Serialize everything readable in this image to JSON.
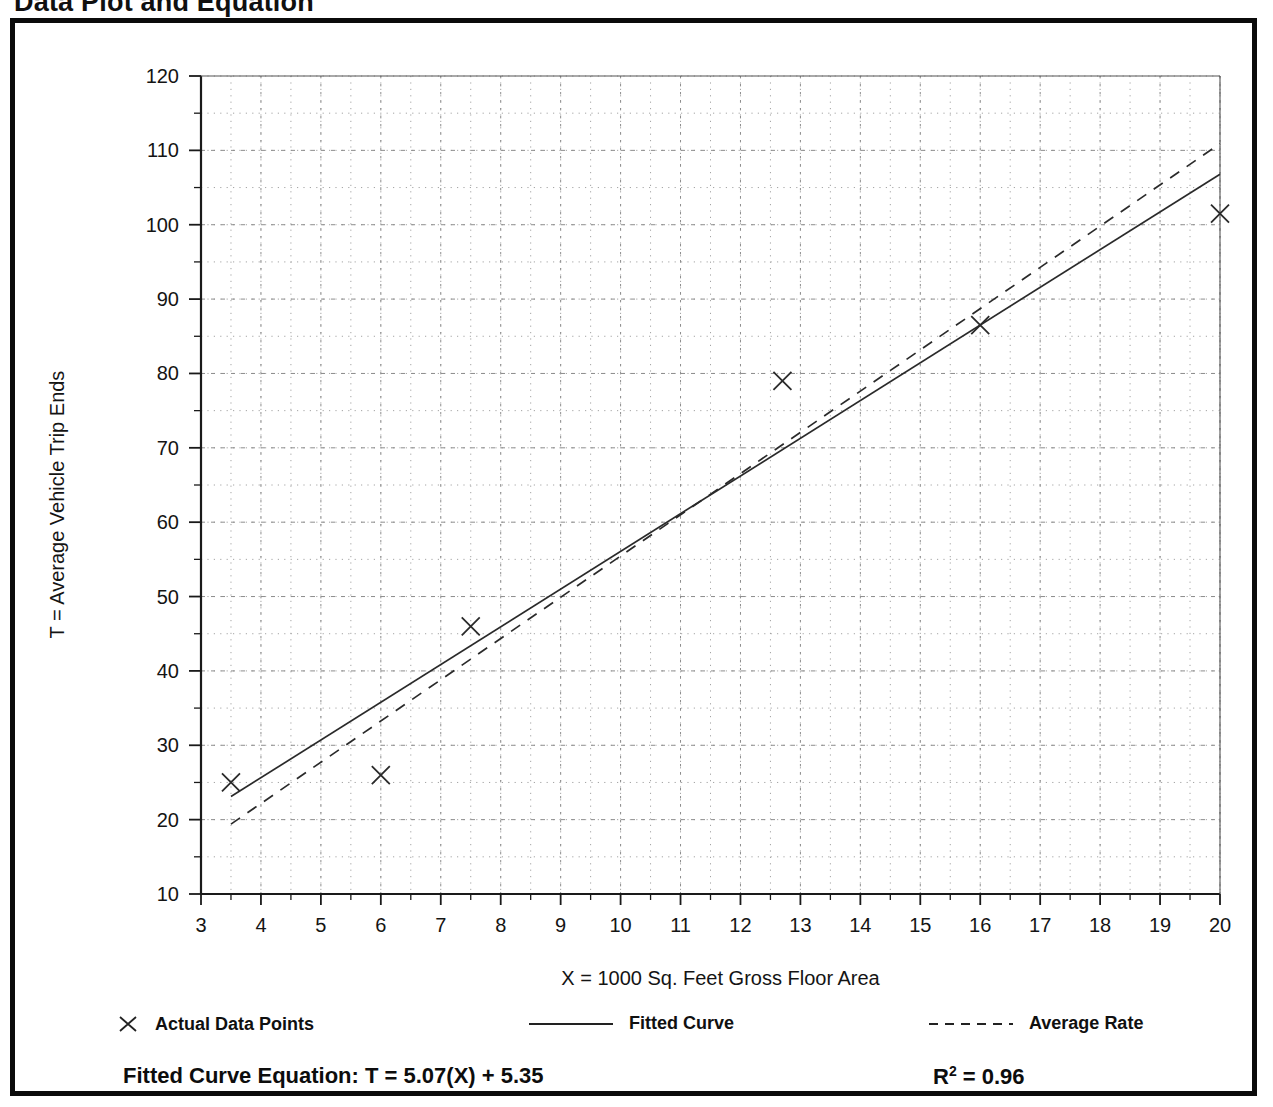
{
  "page_title": "Data Plot and Equation",
  "axes": {
    "x_title": "X = 1000 Sq. Feet Gross Floor Area",
    "y_title": "T = Average Vehicle Trip Ends"
  },
  "legend": {
    "items": [
      {
        "label": "Actual Data Points",
        "marker": "x-cross-marker"
      },
      {
        "label": "Fitted Curve",
        "marker": "solid-line-swatch"
      },
      {
        "label": "Average Rate",
        "marker": "dashed-line-swatch"
      }
    ]
  },
  "equation": {
    "label": "Fitted Curve Equation:",
    "expression": "T = 5.07(X) + 5.35",
    "full": "Fitted Curve Equation:  T = 5.07(X) + 5.35",
    "r_squared_label": "R",
    "r_squared_exponent": "2",
    "r_squared_value": "= 0.96",
    "r_squared_full": "R2 = 0.96"
  },
  "chart_data": {
    "type": "scatter",
    "title": "Data Plot and Equation",
    "xlabel": "X = 1000 Sq. Feet Gross Floor Area",
    "ylabel": "T = Average Vehicle Trip Ends",
    "xlim": [
      3,
      20
    ],
    "ylim": [
      10,
      120
    ],
    "xticks": [
      3,
      4,
      5,
      6,
      7,
      8,
      9,
      10,
      11,
      12,
      13,
      14,
      15,
      16,
      17,
      18,
      19,
      20
    ],
    "yticks": [
      10,
      20,
      30,
      40,
      50,
      60,
      70,
      80,
      90,
      100,
      110,
      120
    ],
    "xtick_labels": [
      "3",
      "4",
      "5",
      "6",
      "7",
      "8",
      "9",
      "10",
      "11",
      "12",
      "13",
      "14",
      "15",
      "16",
      "17",
      "18",
      "19",
      "20"
    ],
    "ytick_labels": [
      "10",
      "20",
      "30",
      "40",
      "50",
      "60",
      "70",
      "80",
      "90",
      "100",
      "110",
      "120"
    ],
    "x_minor_step": 0.5,
    "y_minor_step": 5,
    "grid": true,
    "grid_style": "dotted",
    "legend_position": "below-axes",
    "series": [
      {
        "name": "Actual Data Points",
        "type": "scatter",
        "marker": "x",
        "points": [
          {
            "x": 3.5,
            "y": 25.0
          },
          {
            "x": 6.0,
            "y": 26.0
          },
          {
            "x": 7.5,
            "y": 46.0
          },
          {
            "x": 12.7,
            "y": 79.0
          },
          {
            "x": 16.0,
            "y": 86.5
          },
          {
            "x": 20.0,
            "y": 101.5
          }
        ]
      },
      {
        "name": "Fitted Curve",
        "type": "line",
        "style": "solid",
        "equation": "T = 5.07(X) + 5.35",
        "slope": 5.07,
        "intercept": 5.35,
        "r_squared": 0.96,
        "x_range": [
          3.5,
          20.0
        ],
        "endpoints": [
          {
            "x": 3.5,
            "y": 23.1
          },
          {
            "x": 20.0,
            "y": 106.8
          }
        ]
      },
      {
        "name": "Average Rate",
        "type": "line",
        "style": "dashed",
        "x_range": [
          3.5,
          20.0
        ],
        "endpoints": [
          {
            "x": 3.5,
            "y": 19.4
          },
          {
            "x": 20.0,
            "y": 110.9
          }
        ]
      }
    ]
  },
  "colors": {
    "border": "#0b0b0b",
    "axis": "#1a1a1a",
    "grid": "#9a9a9a",
    "data": "#2a2a2a",
    "background": "#ffffff"
  }
}
